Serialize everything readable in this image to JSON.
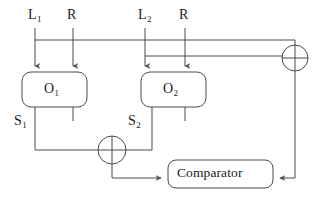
{
  "diagram": {
    "type": "block-diagram",
    "stroke_color": "#4a4a4a",
    "text_color": "#1a1a1a",
    "background_color": "#ffffff",
    "inputs": [
      {
        "id": "L1",
        "base": "L",
        "sub": "1",
        "x": 35,
        "label_x": 28,
        "label_y": 8
      },
      {
        "id": "R1",
        "base": "R",
        "sub": "",
        "x": 73,
        "label_x": 67,
        "label_y": 8
      },
      {
        "id": "L2",
        "base": "L",
        "sub": "2",
        "x": 145,
        "label_x": 138,
        "label_y": 8
      },
      {
        "id": "R2",
        "base": "R",
        "sub": "",
        "x": 185,
        "label_x": 179,
        "label_y": 8
      }
    ],
    "blocks": [
      {
        "id": "O1",
        "base": "O",
        "sub": "1",
        "x": 22,
        "y": 72,
        "w": 65,
        "h": 35
      },
      {
        "id": "O2",
        "base": "O",
        "sub": "2",
        "x": 141,
        "y": 72,
        "w": 65,
        "h": 35
      }
    ],
    "comparator": {
      "label": "Comparator",
      "x": 168,
      "y": 160,
      "w": 105,
      "h": 28
    },
    "signals": [
      {
        "id": "S1",
        "base": "S",
        "sub": "1",
        "label_x": 14,
        "label_y": 114
      },
      {
        "id": "S2",
        "base": "S",
        "sub": "2",
        "label_x": 128,
        "label_y": 114
      }
    ],
    "xor_gates": [
      {
        "id": "xor-mid",
        "cx": 112,
        "cy": 150,
        "r": 14
      },
      {
        "id": "xor-right",
        "cx": 295,
        "cy": 58,
        "r": 13
      }
    ],
    "buses": [
      {
        "id": "bus-upper",
        "y": 40,
        "x1": 35,
        "x2": 295
      },
      {
        "id": "bus-lower",
        "y": 56,
        "x1": 145,
        "x2": 282
      }
    ]
  }
}
